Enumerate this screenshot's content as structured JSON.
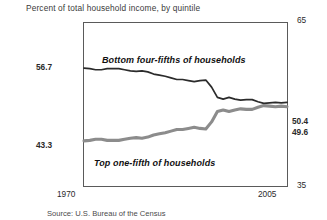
{
  "figure": {
    "title": "Percent of total household income, by quintile",
    "source": "Source: U.S. Bureau of the Census"
  },
  "axis": {
    "y_top_label": "65",
    "y_bottom_label": "35",
    "x_start_label": "1970",
    "x_end_label": "2005",
    "left_value_upper": "56.7",
    "left_value_lower": "43.3",
    "right_value_upper": "50.4",
    "right_value_lower": "49.6"
  },
  "series_labels": {
    "bottom_four_fifths": "Bottom four-fifths of households",
    "top_one_fifth": "Top one-fifth of households"
  },
  "colors": {
    "bottom_line": "#2b2b2b",
    "top_line": "#8c8c8c",
    "frame": "#5a5a5a",
    "text": "#1a1a1a"
  },
  "chart_data": {
    "type": "line",
    "title": "Percent of total household income, by quintile",
    "xlabel": "",
    "ylabel": "",
    "xlim": [
      1970,
      2005
    ],
    "ylim": [
      35,
      65
    ],
    "grid": false,
    "legend": "inline-annotations",
    "x": [
      1970,
      1971,
      1972,
      1973,
      1974,
      1975,
      1976,
      1977,
      1978,
      1979,
      1980,
      1981,
      1982,
      1983,
      1984,
      1985,
      1986,
      1987,
      1988,
      1989,
      1990,
      1991,
      1992,
      1993,
      1994,
      1995,
      1996,
      1997,
      1998,
      1999,
      2000,
      2001,
      2002,
      2003,
      2004,
      2005
    ],
    "series": [
      {
        "name": "Bottom four-fifths of households",
        "color": "#2b2b2b",
        "values": [
          56.7,
          56.6,
          56.4,
          56.4,
          56.6,
          56.6,
          56.6,
          56.4,
          56.2,
          56.1,
          56.2,
          56.0,
          55.6,
          55.4,
          55.2,
          54.9,
          54.6,
          54.6,
          54.4,
          54.2,
          54.4,
          54.5,
          53.2,
          51.3,
          51.0,
          51.3,
          51.0,
          50.8,
          50.9,
          50.9,
          50.5,
          50.2,
          50.3,
          50.4,
          50.3,
          50.4
        ]
      },
      {
        "name": "Top one-fifth of households",
        "color": "#8c8c8c",
        "values": [
          43.3,
          43.4,
          43.6,
          43.6,
          43.4,
          43.4,
          43.4,
          43.6,
          43.8,
          43.9,
          43.8,
          44.0,
          44.4,
          44.6,
          44.8,
          45.1,
          45.4,
          45.4,
          45.6,
          45.8,
          45.6,
          45.5,
          46.8,
          48.7,
          49.0,
          48.7,
          49.0,
          49.2,
          49.1,
          49.1,
          49.5,
          49.8,
          49.7,
          49.6,
          49.7,
          49.6
        ]
      }
    ],
    "annotations": [
      {
        "text": "56.7",
        "at": "left-axis-upper"
      },
      {
        "text": "43.3",
        "at": "left-axis-lower"
      },
      {
        "text": "50.4",
        "at": "right-axis-upper"
      },
      {
        "text": "49.6",
        "at": "right-axis-lower"
      }
    ]
  }
}
